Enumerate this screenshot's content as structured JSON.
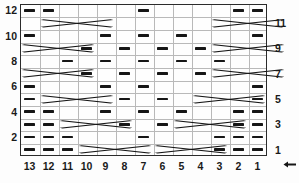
{
  "chart_data": {
    "type": "table",
    "xlabel": "",
    "ylabel": "",
    "grid": true,
    "columns": 13,
    "rows": 12,
    "column_labels": [
      "13",
      "12",
      "11",
      "10",
      "9",
      "8",
      "7",
      "6",
      "5",
      "4",
      "3",
      "2",
      "1"
    ],
    "row_labels_left": [
      "12",
      "10",
      "8",
      "6",
      "4",
      "2"
    ],
    "row_labels_right": [
      "11",
      "9",
      "7",
      "5",
      "3",
      "1"
    ],
    "reading_direction": "right-to-left",
    "legend": [
      {
        "symbol": "dash",
        "name": "purl-stitch"
      },
      {
        "symbol": "blank",
        "name": "knit-stitch"
      },
      {
        "symbol": "cross",
        "name": "cable-cross"
      }
    ],
    "purls": [
      {
        "row": 12,
        "cols": [
          13,
          12,
          7,
          2,
          1
        ]
      },
      {
        "row": 11,
        "cols": []
      },
      {
        "row": 10,
        "cols": [
          13,
          9,
          7,
          5,
          1
        ]
      },
      {
        "row": 9,
        "cols": [
          10,
          8,
          6,
          4
        ]
      },
      {
        "row": 8,
        "cols": [
          11,
          9,
          7,
          5,
          3
        ]
      },
      {
        "row": 7,
        "cols": [
          10,
          8,
          6,
          4
        ]
      },
      {
        "row": 6,
        "cols": [
          13,
          9,
          7,
          1
        ]
      },
      {
        "row": 5,
        "cols": [
          13,
          8,
          6,
          1
        ]
      },
      {
        "row": 4,
        "cols": [
          13,
          12,
          9,
          7,
          5,
          2,
          1
        ]
      },
      {
        "row": 3,
        "cols": [
          13,
          12,
          8,
          6,
          2,
          1
        ]
      },
      {
        "row": 2,
        "cols": [
          13,
          12,
          11,
          7,
          3,
          2,
          1
        ]
      },
      {
        "row": 1,
        "cols": [
          13,
          12,
          11,
          3,
          2,
          1
        ]
      }
    ],
    "cables": [
      {
        "row": 11,
        "start_col": 12,
        "span": 4
      },
      {
        "row": 11,
        "start_col": 3,
        "span": 4
      },
      {
        "row": 9,
        "start_col": 13,
        "span": 4
      },
      {
        "row": 9,
        "start_col": 3,
        "span": 4
      },
      {
        "row": 7,
        "start_col": 13,
        "span": 4
      },
      {
        "row": 7,
        "start_col": 3,
        "span": 4
      },
      {
        "row": 5,
        "start_col": 12,
        "span": 4
      },
      {
        "row": 5,
        "start_col": 4,
        "span": 4
      },
      {
        "row": 3,
        "start_col": 11,
        "span": 4
      },
      {
        "row": 3,
        "start_col": 5,
        "span": 4
      },
      {
        "row": 1,
        "start_col": 10,
        "span": 4
      },
      {
        "row": 1,
        "start_col": 6,
        "span": 4
      }
    ]
  },
  "axis": {
    "bottom_labels": [
      "13",
      "12",
      "11",
      "10",
      "9",
      "8",
      "7",
      "6",
      "5",
      "4",
      "3",
      "2",
      "1"
    ],
    "left_labels": [
      "12",
      "10",
      "8",
      "6",
      "4",
      "2"
    ],
    "right_labels": [
      "11",
      "9",
      "7",
      "5",
      "3",
      "1"
    ],
    "start_marker": "1"
  },
  "colors": {
    "symbol": "#161616",
    "grid_line": "#b9b9b9",
    "border": "#2b2b2b",
    "background": "#fdfdfd",
    "label": "#1a1a1a"
  }
}
